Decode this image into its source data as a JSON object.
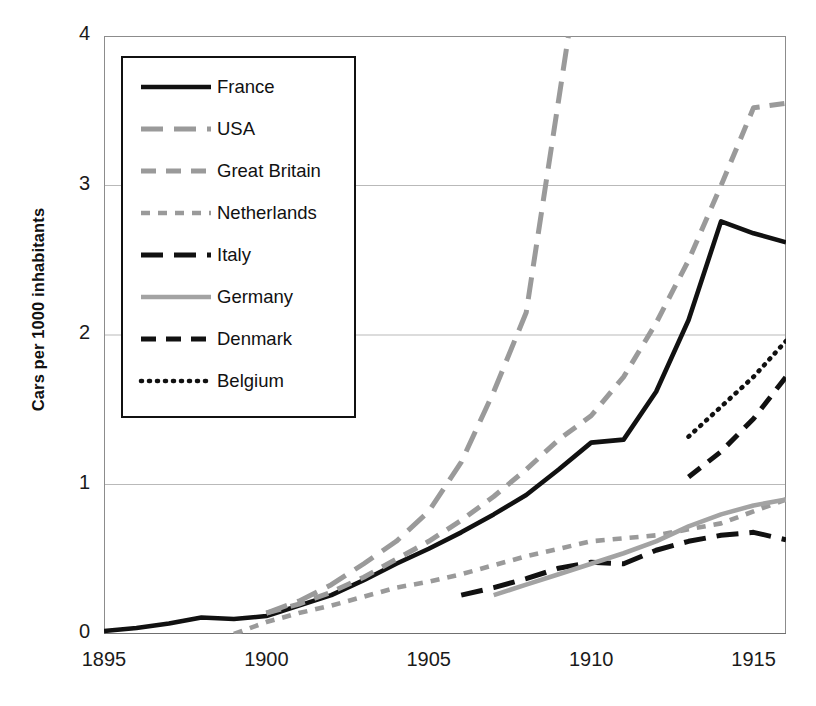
{
  "chart_data": {
    "type": "line",
    "title": "",
    "xlabel": "",
    "ylabel": "Cars per 1000 inhabitants",
    "xlim": [
      1895,
      1916
    ],
    "ylim": [
      0,
      4
    ],
    "xticks": [
      1895,
      1900,
      1905,
      1910,
      1915
    ],
    "yticks": [
      0,
      1,
      2,
      3,
      4
    ],
    "grid": "horizontal",
    "legend_position": "upper-left-inside",
    "series": [
      {
        "name": "France",
        "style": "solid",
        "color": "#111111",
        "x": [
          1895,
          1896,
          1897,
          1898,
          1899,
          1900,
          1901,
          1902,
          1903,
          1904,
          1905,
          1906,
          1907,
          1908,
          1909,
          1910,
          1911,
          1912,
          1913,
          1914,
          1915,
          1916
        ],
        "y": [
          0.02,
          0.04,
          0.07,
          0.11,
          0.1,
          0.12,
          0.19,
          0.26,
          0.36,
          0.47,
          0.57,
          0.68,
          0.8,
          0.93,
          1.1,
          1.28,
          1.3,
          1.62,
          2.1,
          2.76,
          2.68,
          2.62
        ]
      },
      {
        "name": "USA",
        "style": "long-dash",
        "color": "#9a9a9a",
        "x": [
          1900,
          1901,
          1902,
          1903,
          1904,
          1905,
          1906,
          1907,
          1908,
          1909.3
        ],
        "y": [
          0.14,
          0.22,
          0.33,
          0.47,
          0.62,
          0.82,
          1.15,
          1.62,
          2.15,
          4.0
        ]
      },
      {
        "name": "Great Britain",
        "style": "dash",
        "color": "#9a9a9a",
        "x": [
          1900,
          1901,
          1902,
          1903,
          1904,
          1905,
          1906,
          1907,
          1908,
          1909,
          1910,
          1911,
          1912,
          1913,
          1914,
          1915,
          1916
        ],
        "y": [
          0.14,
          0.2,
          0.28,
          0.38,
          0.5,
          0.62,
          0.76,
          0.92,
          1.1,
          1.3,
          1.46,
          1.72,
          2.08,
          2.5,
          3.0,
          3.52,
          3.55
        ]
      },
      {
        "name": "Netherlands",
        "style": "short-dash",
        "color": "#9a9a9a",
        "x": [
          1899,
          1900,
          1901,
          1902,
          1903,
          1904,
          1905,
          1906,
          1907,
          1908,
          1909,
          1910,
          1911,
          1912,
          1913,
          1914,
          1915,
          1916
        ],
        "y": [
          0.0,
          0.08,
          0.14,
          0.19,
          0.25,
          0.31,
          0.35,
          0.4,
          0.46,
          0.52,
          0.57,
          0.62,
          0.64,
          0.66,
          0.7,
          0.74,
          0.82,
          0.9
        ]
      },
      {
        "name": "Italy",
        "style": "long-dash",
        "color": "#111111",
        "x": [
          1906,
          1907,
          1908,
          1909,
          1910,
          1911,
          1912,
          1913,
          1914,
          1915,
          1916
        ],
        "y": [
          0.26,
          0.31,
          0.37,
          0.44,
          0.48,
          0.47,
          0.56,
          0.62,
          0.66,
          0.68,
          0.63
        ]
      },
      {
        "name": "Germany",
        "style": "solid",
        "color": "#a3a3a3",
        "x": [
          1907,
          1908,
          1909,
          1910,
          1911,
          1912,
          1913,
          1914,
          1915,
          1916
        ],
        "y": [
          0.26,
          0.33,
          0.4,
          0.47,
          0.54,
          0.62,
          0.72,
          0.8,
          0.86,
          0.9
        ]
      },
      {
        "name": "Denmark",
        "style": "dash",
        "color": "#111111",
        "x": [
          1913,
          1914,
          1915,
          1916
        ],
        "y": [
          1.05,
          1.22,
          1.44,
          1.72
        ]
      },
      {
        "name": "Belgium",
        "style": "dotted",
        "color": "#111111",
        "x": [
          1913,
          1914,
          1915,
          1916
        ],
        "y": [
          1.32,
          1.52,
          1.72,
          1.96
        ]
      }
    ]
  },
  "axes": {
    "y_axis_title": "Cars per 1000 inhabitants",
    "y_tick_labels": [
      "4",
      "3",
      "2",
      "1",
      "0"
    ],
    "x_tick_labels": [
      "1895",
      "1900",
      "1905",
      "1910",
      "1915"
    ]
  },
  "legend": {
    "items": [
      {
        "label": "France",
        "style": "solid",
        "color": "#111111"
      },
      {
        "label": "USA",
        "style": "long-dash",
        "color": "#9a9a9a"
      },
      {
        "label": "Great Britain",
        "style": "dash",
        "color": "#9a9a9a"
      },
      {
        "label": "Netherlands",
        "style": "short-dash",
        "color": "#9a9a9a"
      },
      {
        "label": "Italy",
        "style": "long-dash",
        "color": "#111111"
      },
      {
        "label": "Germany",
        "style": "solid",
        "color": "#a3a3a3"
      },
      {
        "label": "Denmark",
        "style": "dash",
        "color": "#111111"
      },
      {
        "label": "Belgium",
        "style": "dotted",
        "color": "#111111"
      }
    ]
  }
}
